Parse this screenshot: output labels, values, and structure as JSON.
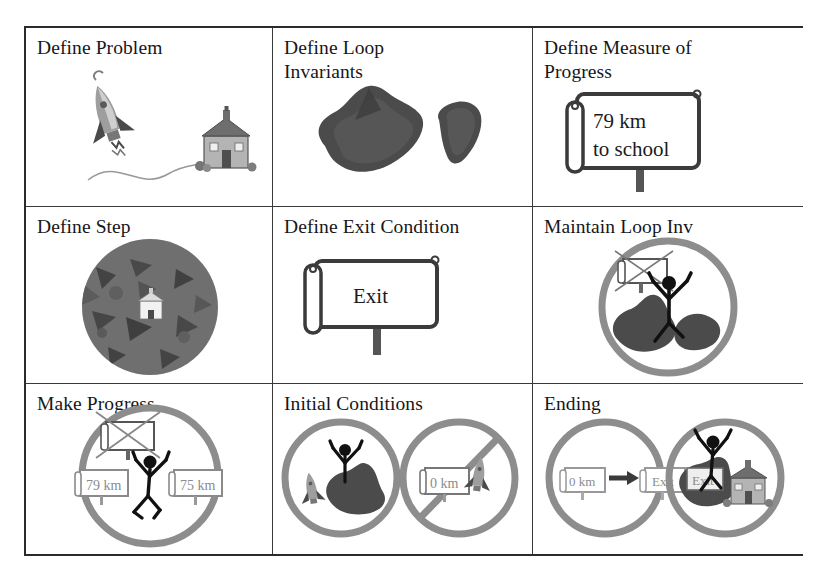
{
  "figure": {
    "layout": "3x3-grid",
    "background_color": "#ffffff",
    "border_color": "#2b2b2b",
    "grid_line_color": "#3a3a3a",
    "ring_color": "#8d8d8d",
    "rock_color": "#4e4e4e",
    "text_color": "#16161a"
  },
  "cells": [
    {
      "id": "define-problem",
      "title": "Define Problem",
      "row": 1,
      "col": 1,
      "art": "rocket launching toward a schoolhouse connected by a winding path"
    },
    {
      "id": "define-loop-invariants",
      "title": "Define Loop\nInvariants",
      "row": 1,
      "col": 2,
      "art": "two dark grey rock / mountain shapes"
    },
    {
      "id": "define-measure-of-progress",
      "title": "Define Measure of\nProgress",
      "row": 1,
      "col": 3,
      "art": "road sign on a post",
      "sign_lines": [
        "79 km",
        "to school"
      ]
    },
    {
      "id": "define-step",
      "title": "Define Step",
      "row": 2,
      "col": 1,
      "art": "dark textured circle with a small white schoolhouse at its center"
    },
    {
      "id": "define-exit-condition",
      "title": "Define Exit Condition",
      "row": 2,
      "col": 2,
      "art": "road sign on a post",
      "sign_lines": [
        "Exit"
      ]
    },
    {
      "id": "maintain-loop-inv",
      "title": "Maintain Loop Inv",
      "row": 2,
      "col": 3,
      "art": "circle containing stick figure standing on rocks beside a crossed-out sign"
    },
    {
      "id": "make-progress",
      "title": "Make Progress",
      "row": 3,
      "col": 1,
      "art": "circle with crossed-out sign above and stick figure between two distance signs",
      "mini_signs": [
        "79 km",
        "75 km"
      ]
    },
    {
      "id": "initial-conditions",
      "title": "Initial Conditions",
      "row": 3,
      "col": 2,
      "art": "two circles: stick figure on rock with rocket, and a slashed circle over sign plus rocket",
      "mini_signs": [
        "0 km"
      ]
    },
    {
      "id": "ending",
      "title": "Ending",
      "row": 3,
      "col": 3,
      "art": "two circles: sign with arrow to Exit sign, and stick figure with rock, Exit sign and schoolhouse",
      "mini_signs": [
        "0 km",
        "Exit",
        "Exit"
      ]
    }
  ]
}
